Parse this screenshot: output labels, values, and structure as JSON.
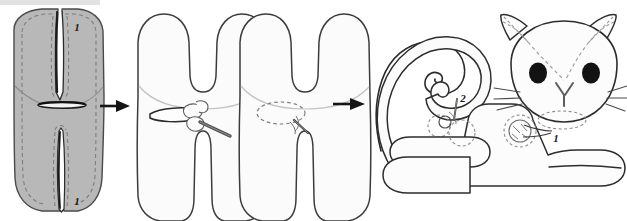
{
  "document": {
    "title": "Plush Cat Sewing Tutorial Diagram",
    "type": "illustrated-craft-instructions",
    "background_color": "#ffffff"
  },
  "palette": {
    "fabric_gray_fill": "#b8b8b8",
    "fabric_gray_stroke": "#4a4a4a",
    "panel_white_fill": "#fbfbfb",
    "panel_white_stroke": "#3c3c3c",
    "dashed_seam": "#9a9a9a",
    "arrow_color": "#151515",
    "eye_color": "#131313",
    "label_color": "#1a1a1a",
    "top_band_color": "#e2e2e2",
    "needle_color": "#6e6e6e"
  },
  "steps": [
    {
      "id": "step-1",
      "name": "gray-fabric-body-panel",
      "caption_labels": [
        "1",
        "1"
      ],
      "description": "Gray fabric body panel with center seam slits top and bottom, a dashed stitch line, and a horizontal turning slit in the middle."
    },
    {
      "id": "step-2",
      "name": "stuffing-through-slit-panel",
      "caption_labels": [],
      "description": "Turned white body shape with legs; stuffing being pushed in through the opening with a stuffing tool."
    },
    {
      "id": "step-3",
      "name": "closing-slit-panel",
      "caption_labels": [],
      "description": "White body shape with the opening drawn as a dashed oval and a needle closing the seam."
    },
    {
      "id": "step-4",
      "name": "assembled-cat-panel",
      "caption_labels": [
        "2",
        "1"
      ],
      "description": "Assembled plush cat: curved tail attached at point 2, head with ears, eyes, nose and whiskers attached at point 1, and stuffed body with legs."
    }
  ],
  "arrows": [
    {
      "name": "arrow-step1-to-step2",
      "label": "→",
      "x": 96,
      "y": 106
    },
    {
      "name": "arrow-step3-to-step4",
      "label": "→",
      "x": 333,
      "y": 104
    }
  ],
  "callouts": [
    {
      "name": "callout-1-top-left",
      "text": "1",
      "x": 77,
      "y": 31,
      "step": "step-1"
    },
    {
      "name": "callout-1-bottom-left",
      "text": "1",
      "x": 77,
      "y": 205,
      "step": "step-1"
    },
    {
      "name": "callout-2-tail-join",
      "text": "2",
      "x": 462,
      "y": 102,
      "step": "step-4"
    },
    {
      "name": "callout-1-head-join",
      "text": "1",
      "x": 553,
      "y": 140,
      "step": "step-4"
    }
  ],
  "features": {
    "cat": {
      "eye_left": {
        "name": "cat-eye-left",
        "cx": 538,
        "cy": 73,
        "rx": 9,
        "ry": 10
      },
      "eye_right": {
        "name": "cat-eye-right",
        "cx": 591,
        "cy": 73,
        "rx": 9,
        "ry": 10
      },
      "whisker_count_per_side": 3,
      "ear_count": 2,
      "leg_count": 2,
      "has_tail": true,
      "has_nose": true
    },
    "step1": {
      "turning_slit": {
        "name": "turning-slit",
        "cx": 62,
        "cy": 105,
        "rx": 24,
        "ry": 3
      }
    }
  }
}
